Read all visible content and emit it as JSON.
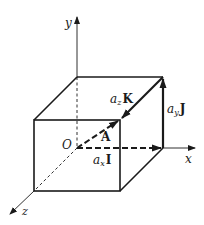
{
  "diagram": {
    "axes": {
      "x_label": "x",
      "y_label": "y",
      "z_label": "z",
      "origin_label": "O"
    },
    "vectors": {
      "resultant": "A",
      "x_component": {
        "coef": "a",
        "sub": "x",
        "unit": "I"
      },
      "y_component": {
        "coef": "a",
        "sub": "y",
        "unit": "J"
      },
      "z_component": {
        "coef": "a",
        "sub": "z",
        "unit": "K"
      }
    },
    "colors": {
      "ink": "#1a1a1a",
      "background": "#ffffff"
    }
  }
}
